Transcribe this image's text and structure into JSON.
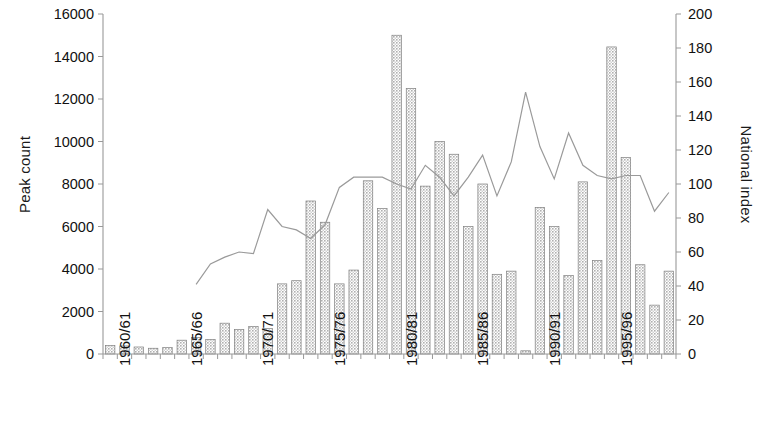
{
  "chart_data": {
    "type": "bar",
    "title": "",
    "xlabel": "",
    "ylabel": "Peak count",
    "y2label": "National index",
    "ylim": [
      0,
      16000
    ],
    "y2lim": [
      0,
      200
    ],
    "ytick_step": 2000,
    "y2tick_step": 20,
    "grid": false,
    "legend": "none",
    "yticks": [
      "0",
      "2000",
      "4000",
      "6000",
      "8000",
      "10000",
      "12000",
      "14000",
      "16000"
    ],
    "y2ticks": [
      "0",
      "20",
      "40",
      "60",
      "80",
      "100",
      "120",
      "140",
      "160",
      "180",
      "200"
    ],
    "categories": [
      "1960/61",
      "1961/62",
      "1962/63",
      "1963/64",
      "1964/65",
      "1965/66",
      "1966/67",
      "1967/68",
      "1968/69",
      "1969/70",
      "1970/71",
      "1971/72",
      "1972/73",
      "1973/74",
      "1974/75",
      "1975/76",
      "1976/77",
      "1977/78",
      "1978/79",
      "1979/80",
      "1980/81",
      "1981/82",
      "1982/83",
      "1983/84",
      "1984/85",
      "1985/86",
      "1986/87",
      "1987/88",
      "1988/89",
      "1989/90",
      "1990/91",
      "1991/92",
      "1992/93",
      "1993/94",
      "1994/95",
      "1995/96",
      "1996/97",
      "1997/98",
      "1998/99",
      "1999/00"
    ],
    "xtick_labels": [
      "1960/61",
      "1965/66",
      "1970/71",
      "1975/76",
      "1980/81",
      "1985/86",
      "1990/91",
      "1995/96"
    ],
    "xtick_indices": [
      0,
      5,
      10,
      15,
      20,
      25,
      30,
      35
    ],
    "series": [
      {
        "name": "Peak count",
        "axis": "left",
        "type": "bar",
        "values": [
          400,
          380,
          330,
          270,
          300,
          650,
          780,
          680,
          1450,
          1150,
          1300,
          1200,
          3300,
          3450,
          7200,
          6200,
          3300,
          3950,
          8150,
          6850,
          15000,
          12500,
          7900,
          10000,
          9400,
          6000,
          8000,
          3750,
          3900,
          150,
          6900,
          6000,
          3700,
          8100,
          4400,
          14450,
          9250,
          4200,
          2300,
          3900
        ]
      },
      {
        "name": "National index",
        "axis": "right",
        "type": "line",
        "start_index": 6,
        "values": [
          25,
          26,
          32,
          30,
          28,
          33,
          41,
          53,
          57,
          60,
          59,
          85,
          75,
          73,
          68,
          76,
          98,
          104,
          104,
          104,
          100,
          97,
          111,
          104,
          93,
          104,
          117,
          93,
          113,
          154,
          122,
          103,
          130,
          111,
          105,
          103,
          105,
          105,
          84,
          95
        ]
      }
    ],
    "bar_color": "#bdbdbd",
    "bar_edge_color": "#808080",
    "line_color": "#9a9a9a",
    "axis_color": "#999999"
  }
}
